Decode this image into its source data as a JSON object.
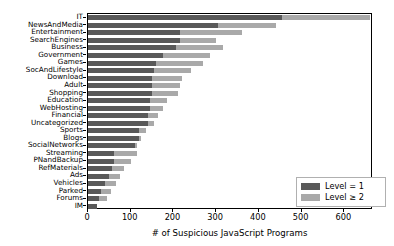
{
  "chart_data": {
    "type": "bar",
    "orientation": "horizontal",
    "stacked": true,
    "title": "",
    "xlabel": "# of Suspicious JavaScript Programs",
    "ylabel": "",
    "xlim": [
      0,
      667
    ],
    "xticks": [
      0,
      100,
      200,
      300,
      400,
      500,
      600
    ],
    "xticklabels": [
      "0",
      "100",
      "200",
      "300",
      "400",
      "500",
      "600"
    ],
    "grid": false,
    "legend_position": "lower right",
    "categories": [
      "IT",
      "NewsAndMedia",
      "Entertainment",
      "SearchEngines",
      "Business",
      "Government",
      "Games",
      "SocAndLifestyle",
      "Download",
      "Adult",
      "Shopping",
      "Education",
      "WebHosting",
      "Financial",
      "Uncategorized",
      "Sports",
      "Blogs",
      "SocialNetworks",
      "Streaming",
      "PNandBackup",
      "RefMaterials",
      "Ads",
      "Vehicles",
      "Parked",
      "Forums",
      "IM"
    ],
    "series": [
      {
        "name": "Level = 1",
        "color": "#595959",
        "values": [
          455,
          305,
          215,
          215,
          205,
          175,
          160,
          155,
          150,
          150,
          150,
          145,
          145,
          140,
          140,
          120,
          120,
          110,
          60,
          60,
          55,
          50,
          40,
          30,
          25,
          20
        ]
      },
      {
        "name": "Level ≥ 2",
        "color": "#a9a9a9",
        "values": [
          205,
          135,
          145,
          85,
          110,
          110,
          110,
          85,
          70,
          65,
          60,
          40,
          30,
          25,
          15,
          15,
          5,
          5,
          55,
          40,
          30,
          25,
          25,
          25,
          20,
          0
        ]
      }
    ],
    "totals": [
      660,
      440,
      360,
      300,
      315,
      285,
      270,
      240,
      220,
      215,
      210,
      185,
      175,
      165,
      155,
      135,
      125,
      115,
      115,
      100,
      85,
      75,
      65,
      55,
      45,
      20
    ]
  },
  "legend": {
    "entries": [
      {
        "label": "Level = 1"
      },
      {
        "label": "Level ≥ 2"
      }
    ]
  }
}
